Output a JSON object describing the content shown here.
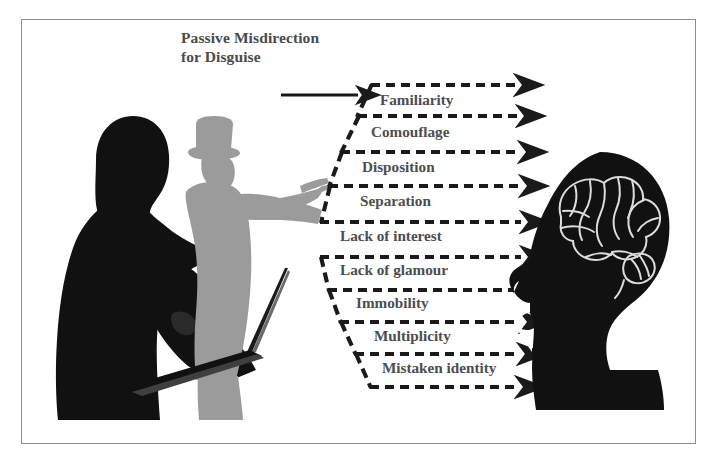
{
  "figure": {
    "background_color": "#ffffff",
    "frame_color": "#8d8d8d",
    "text_color": "#4d4d4d",
    "arrow_color": "#1a1a1a",
    "silhouette_dark_color": "#111111",
    "silhouette_gray_color": "#9b9b9b"
  },
  "caption": {
    "line1": "Passive Misdirection",
    "line2": "for Disguise"
  },
  "flow": {
    "source_arrow_name": "solid-source-arrow",
    "items": [
      {
        "label": "Familiarity"
      },
      {
        "label": "Comouflage"
      },
      {
        "label": "Disposition"
      },
      {
        "label": "Separation"
      },
      {
        "label": "Lack of interest"
      },
      {
        "label": "Lack of glamour"
      },
      {
        "label": "Immobility"
      },
      {
        "label": "Multiplicity"
      },
      {
        "label": "Mistaken identity"
      }
    ]
  },
  "actors": {
    "observer": "person-with-laptop-silhouette",
    "disguised_figure": "man-in-top-hat-pointing-silhouette",
    "target": "head-with-brain-silhouette"
  }
}
